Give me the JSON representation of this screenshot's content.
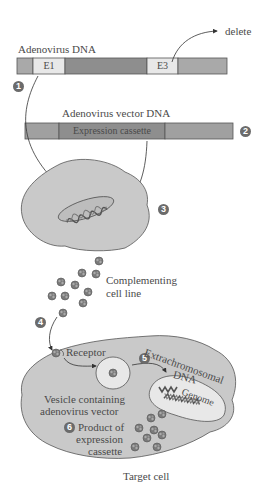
{
  "diagram": {
    "adenovirus_dna": {
      "label": "Adenovirus DNA",
      "segments": [
        {
          "name": "left-end",
          "label": ""
        },
        {
          "name": "E1",
          "label": "E1"
        },
        {
          "name": "middle",
          "label": ""
        },
        {
          "name": "E3",
          "label": "E3"
        },
        {
          "name": "right-end",
          "label": ""
        }
      ],
      "delete_label": "delete"
    },
    "vector_dna": {
      "label": "Adenovirus vector DNA",
      "cassette_label": "Expression cassette"
    },
    "steps": [
      "1",
      "2",
      "3",
      "4",
      "5",
      "6"
    ],
    "labels": {
      "complementing": "Complementing",
      "cell_line": "cell line",
      "receptor": "Receptor",
      "extrachromosomal": "Extrachromosomal",
      "dna": "DNA",
      "genome": "Genome",
      "vesicle_line1": "Vesicle containing",
      "vesicle_line2": "adenovirus vector",
      "product_line1": "Product of",
      "product_line2": "expression",
      "product_line3": "cassette",
      "target_cell": "Target cell"
    },
    "colors": {
      "cell_fill": "#c9c9c9",
      "dark_segment": "#8e8e8e",
      "mid_segment": "#a9a9a9",
      "light_segment": "#e8e8e8",
      "step_circle": "#6b6b6b",
      "outline": "#555555"
    }
  }
}
